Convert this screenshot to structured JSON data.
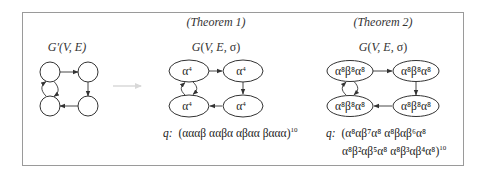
{
  "figure": {
    "frame": {
      "x": 22,
      "y": 12,
      "width": 441,
      "height": 153,
      "stroke": "#9a9a9a"
    },
    "transform_arrow": {
      "color": "#d8d8d8",
      "from_x": 113,
      "to_x": 142,
      "y": 86
    },
    "panels": [
      {
        "id": "original",
        "heading": "",
        "graph_label": "G'(V, E)",
        "node_shape": "circle",
        "nodes": [
          {
            "id": "tl",
            "label": ""
          },
          {
            "id": "tr",
            "label": ""
          },
          {
            "id": "br",
            "label": ""
          },
          {
            "id": "bl",
            "label": ""
          }
        ],
        "edges": [
          {
            "from": "tl",
            "to": "tr"
          },
          {
            "from": "tr",
            "to": "br"
          },
          {
            "from": "br",
            "to": "bl"
          },
          {
            "from": "bl",
            "to": "tl"
          },
          {
            "from": "tl",
            "to": "bl"
          }
        ],
        "q_lines": []
      },
      {
        "id": "theorem1",
        "heading": "(Theorem 1)",
        "graph_label": "G(V, E, σ)",
        "node_shape": "ellipse",
        "nodes": [
          {
            "id": "tl",
            "base": "α",
            "exp": "4"
          },
          {
            "id": "tr",
            "base": "α",
            "exp": "4"
          },
          {
            "id": "br",
            "base": "α",
            "exp": "4"
          },
          {
            "id": "bl",
            "base": "α",
            "exp": "4"
          }
        ],
        "edges": [
          {
            "from": "tl",
            "to": "tr"
          },
          {
            "from": "tr",
            "to": "br"
          },
          {
            "from": "br",
            "to": "bl"
          },
          {
            "from": "bl",
            "to": "tl"
          },
          {
            "from": "tl",
            "to": "bl"
          }
        ],
        "q_prefix": "q:",
        "q_lines": [
          "(αααβ  ααβα  αβαα  βααα)"
        ],
        "q_exponent": "10"
      },
      {
        "id": "theorem2",
        "heading": "(Theorem 2)",
        "graph_label": "G(V, E, σ)",
        "node_shape": "ellipse",
        "nodes": [
          {
            "id": "tl",
            "label": "α⁸β⁸α⁸"
          },
          {
            "id": "tr",
            "label": "α⁸β⁸α⁸"
          },
          {
            "id": "br",
            "label": "α⁸β⁸α⁸"
          },
          {
            "id": "bl",
            "label": "α⁸β⁸α⁸"
          }
        ],
        "edges": [
          {
            "from": "tl",
            "to": "tr"
          },
          {
            "from": "tr",
            "to": "br"
          },
          {
            "from": "br",
            "to": "bl"
          },
          {
            "from": "bl",
            "to": "tl"
          },
          {
            "from": "tl",
            "to": "bl"
          }
        ],
        "q_prefix": "q:",
        "q_lines": [
          "(α⁸αβ⁷α⁸     α⁸βαβ⁶α⁸",
          "α⁸β²αβ⁵α⁸  α⁸β³αβ⁴α⁸)"
        ],
        "q_exponent": "10"
      }
    ]
  }
}
